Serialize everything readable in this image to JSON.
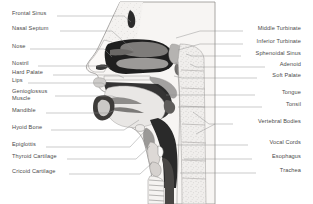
{
  "diagram": {
    "background_color": "#ffffff",
    "label_color": "#4a4a4a",
    "leader_color": "#8d8d8d",
    "palette": {
      "skin_outline": "#8a8a8a",
      "soft_tissue_light": "#e6e4e2",
      "soft_tissue_mid": "#b9b7b5",
      "soft_tissue_dark": "#6e6c6a",
      "airway_black": "#1e1e1e",
      "bone_light": "#f1efed",
      "cartilage": "#d2d0ce",
      "vertebra_fill": "#efeeec"
    },
    "labels_left": [
      {
        "id": "frontal-sinus",
        "text": "Frontal Sinus",
        "x": 12,
        "y": 14
      },
      {
        "id": "nasal-septum",
        "text": "Nasal Septum",
        "x": 12,
        "y": 29
      },
      {
        "id": "nose",
        "text": "Nose",
        "x": 12,
        "y": 47
      },
      {
        "id": "nostril",
        "text": "Nostril",
        "x": 12,
        "y": 64
      },
      {
        "id": "hard-palate",
        "text": "Hard Palate",
        "x": 12,
        "y": 73
      },
      {
        "id": "lips",
        "text": "Lips",
        "x": 12,
        "y": 81
      },
      {
        "id": "genioglossus",
        "text": "Genioglossus",
        "x": 12,
        "y": 92
      },
      {
        "id": "genioglossus-2",
        "text": "Muscle",
        "x": 12,
        "y": 99
      },
      {
        "id": "mandible",
        "text": "Mandible",
        "x": 12,
        "y": 111
      },
      {
        "id": "hyoid-bone",
        "text": "Hyoid Bone",
        "x": 12,
        "y": 128
      },
      {
        "id": "epiglottis",
        "text": "Epiglottis",
        "x": 12,
        "y": 145
      },
      {
        "id": "thyroid-cartilage",
        "text": "Thyroid Cartilage",
        "x": 12,
        "y": 157
      },
      {
        "id": "cricoid-cartilage",
        "text": "Cricoid Cartilage",
        "x": 12,
        "y": 172
      }
    ],
    "labels_right": [
      {
        "id": "middle-turbinate",
        "text": "Middle Turbinate",
        "x": 301,
        "y": 29
      },
      {
        "id": "inferior-turbinate",
        "text": "Inferior Turbinate",
        "x": 301,
        "y": 42
      },
      {
        "id": "sphenoidal-sinus",
        "text": "Sphenoidal Sinus",
        "x": 301,
        "y": 54
      },
      {
        "id": "adenoid",
        "text": "Adenoid",
        "x": 301,
        "y": 65
      },
      {
        "id": "soft-palate",
        "text": "Soft Palate",
        "x": 301,
        "y": 76
      },
      {
        "id": "tongue",
        "text": "Tongue",
        "x": 301,
        "y": 93
      },
      {
        "id": "tonsil",
        "text": "Tonsil",
        "x": 301,
        "y": 105
      },
      {
        "id": "vertebral-bodies",
        "text": "Vertebral Bodies",
        "x": 301,
        "y": 122
      },
      {
        "id": "vocal-cords",
        "text": "Vocal Cords",
        "x": 301,
        "y": 143
      },
      {
        "id": "esophagus",
        "text": "Esophagus",
        "x": 301,
        "y": 157
      },
      {
        "id": "trachea",
        "text": "Trachea",
        "x": 301,
        "y": 171
      }
    ],
    "leaders_left": [
      {
        "id": "frontal-sinus",
        "d": "M 57,16  L 124,16  L 131,22"
      },
      {
        "id": "nasal-septum",
        "d": "M 60,31  L 112,31  L 133,50"
      },
      {
        "id": "nose",
        "d": "M 30,49  L 104,49  L 112,57"
      },
      {
        "id": "nostril",
        "d": "M 38,66  L 104,66  L 110,68"
      },
      {
        "id": "hard-palate",
        "d": "M 53,75  L 118,75  L 124,78"
      },
      {
        "id": "lips",
        "d": "M 28,83  L 102,83  L 106,85"
      },
      {
        "id": "genioglossus",
        "d": "M 55,96  L 112,96  L 124,100"
      },
      {
        "id": "mandible",
        "d": "M 46,113 L 108,113 L 115,110"
      },
      {
        "id": "hyoid-bone",
        "d": "M 51,130 L 124,130 L 139,120"
      },
      {
        "id": "epiglottis",
        "d": "M 46,147 L 130,147 L 146,130"
      },
      {
        "id": "thyroid-cartilage",
        "d": "M 67,159 L 136,159 L 150,146"
      },
      {
        "id": "cricoid-cartilage",
        "d": "M 69,174 L 140,174 L 152,163"
      }
    ],
    "leaders_right": [
      {
        "id": "middle-turbinate",
        "d": "M 243,31  L 200,31  L 176,38"
      },
      {
        "id": "inferior-turbinate",
        "d": "M 243,44  L 200,44  L 178,50"
      },
      {
        "id": "sphenoidal-sinus",
        "d": "M 241,56  L 192,56  L 186,54"
      },
      {
        "id": "adenoid",
        "d": "M 265,67  L 196,67  L 190,64"
      },
      {
        "id": "soft-palate",
        "d": "M 257,78  L 182,78  L 174,76"
      },
      {
        "id": "tongue",
        "d": "M 255,95  L 166,95"
      },
      {
        "id": "tonsil",
        "d": "M 262,107 L 178,107"
      },
      {
        "id": "vertebral-bodies",
        "d": "M 233,124 L 209,124 L 193,112"
      },
      {
        "id": "vertebral-bodies-2",
        "d": "M 215,124 L 196,134"
      },
      {
        "id": "vocal-cords",
        "d": "M 248,145 L 176,145"
      },
      {
        "id": "esophagus",
        "d": "M 252,159 L 184,159"
      },
      {
        "id": "trachea",
        "d": "M 256,173 L 180,173"
      }
    ]
  }
}
